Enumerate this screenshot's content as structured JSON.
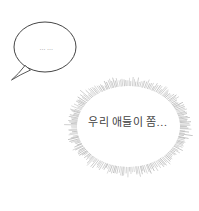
{
  "panel": {
    "background_color": "#ffffff"
  },
  "speech_bubble": {
    "text": "……",
    "stroke_color": "#454545",
    "fill_color": "#ffffff",
    "text_color": "#8f8f8f"
  },
  "burst_bubble": {
    "text": "우리 애들이 쫌…",
    "text_color": "#3f3f3f",
    "spike_color": "#8a8a8a",
    "fill_color": "#ffffff"
  }
}
